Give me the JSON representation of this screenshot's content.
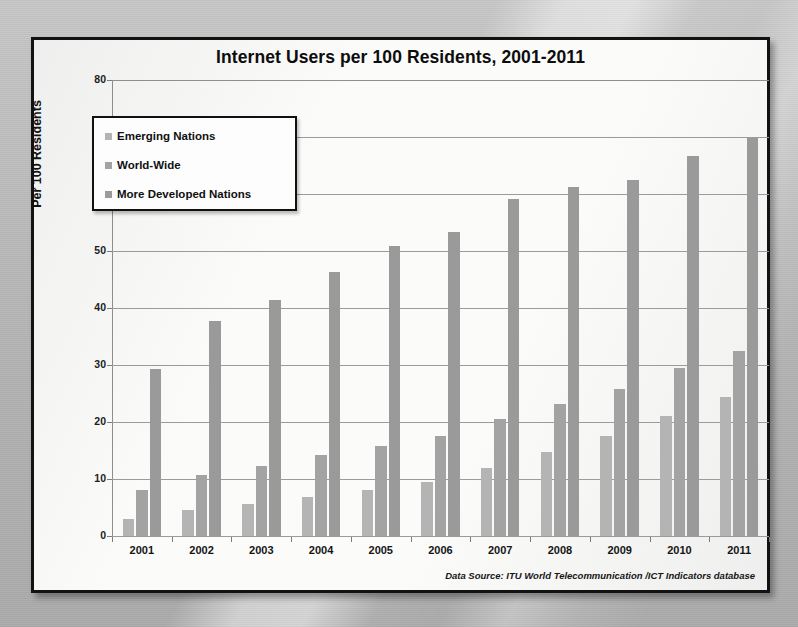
{
  "slide": {
    "panel_name": "chart-panel"
  },
  "chart_data": {
    "type": "bar",
    "title": "Internet Users per 100 Residents, 2001-2011",
    "xlabel": "",
    "ylabel": "Per 100 Residents",
    "ylim": [
      0,
      80
    ],
    "yticks": [
      0,
      10,
      20,
      30,
      40,
      50,
      60,
      70,
      80
    ],
    "grid": true,
    "legend_position": "upper-left-inside",
    "categories": [
      "2001",
      "2002",
      "2003",
      "2004",
      "2005",
      "2006",
      "2007",
      "2008",
      "2009",
      "2010",
      "2011"
    ],
    "series": [
      {
        "name": "Emerging Nations",
        "color": "#b4b4b4",
        "values": [
          2.9,
          4.5,
          5.7,
          6.8,
          8.0,
          9.4,
          11.9,
          14.7,
          17.5,
          21.0,
          24.4
        ]
      },
      {
        "name": "World-Wide",
        "color": "#a3a3a3",
        "values": [
          8.0,
          10.7,
          12.2,
          14.2,
          15.8,
          17.5,
          20.5,
          23.2,
          25.8,
          29.4,
          32.5
        ]
      },
      {
        "name": "More Developed Nations",
        "color": "#9a9a9a",
        "values": [
          29.3,
          37.7,
          41.4,
          46.3,
          50.8,
          53.3,
          59.1,
          61.2,
          62.5,
          66.7,
          70.0
        ]
      }
    ],
    "source_note": "Data Source: ITU World Telecommunication /ICT Indicators database"
  }
}
